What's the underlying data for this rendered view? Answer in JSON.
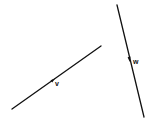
{
  "diagram": {
    "background": "#ffffff",
    "stroke_color": "#111111",
    "vectors": [
      {
        "name": "v",
        "label": "v",
        "start": [
          12,
          109
        ],
        "end": [
          101,
          46
        ],
        "arrow_at": [
          53,
          80
        ],
        "label_pos": [
          55,
          80
        ]
      },
      {
        "name": "w",
        "label": "w",
        "start": [
          117,
          5
        ],
        "end": [
          144,
          117
        ],
        "arrow_at": [
          129,
          59
        ],
        "label_pos": [
          133,
          58
        ]
      }
    ]
  }
}
